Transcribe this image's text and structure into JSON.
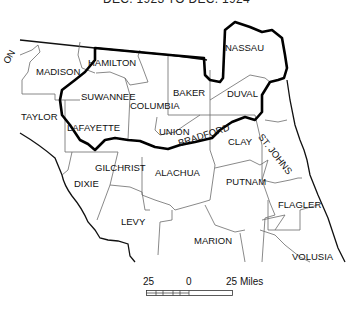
{
  "caption": "DEC. 1923 TO DEC. 1924",
  "counties": [
    {
      "name": "ON",
      "x": 14,
      "y": 52,
      "rotate": -60
    },
    {
      "name": "MADISON",
      "x": 36,
      "y": 67
    },
    {
      "name": "HAMILTON",
      "x": 88,
      "y": 58
    },
    {
      "name": "NASSAU",
      "x": 225,
      "y": 43
    },
    {
      "name": "BAKER",
      "x": 173,
      "y": 88
    },
    {
      "name": "DUVAL",
      "x": 227,
      "y": 89
    },
    {
      "name": "SUWANNEE",
      "x": 81,
      "y": 92
    },
    {
      "name": "COLUMBIA",
      "x": 130,
      "y": 101
    },
    {
      "name": "TAYLOR",
      "x": 21,
      "y": 112
    },
    {
      "name": "LAFAYETTE",
      "x": 67,
      "y": 123
    },
    {
      "name": "UNION",
      "x": 159,
      "y": 127
    },
    {
      "name": "BRADFORD",
      "x": 177,
      "y": 142,
      "rotate": -18
    },
    {
      "name": "CLAY",
      "x": 228,
      "y": 137
    },
    {
      "name": "ST. JOHNS",
      "x": 262,
      "y": 142,
      "rotate": 52
    },
    {
      "name": "GILCHRIST",
      "x": 95,
      "y": 163
    },
    {
      "name": "ALACHUA",
      "x": 155,
      "y": 168
    },
    {
      "name": "DIXIE",
      "x": 74,
      "y": 179
    },
    {
      "name": "PUTNAM",
      "x": 226,
      "y": 177
    },
    {
      "name": "FLAGLER",
      "x": 278,
      "y": 200
    },
    {
      "name": "LEVY",
      "x": 121,
      "y": 217
    },
    {
      "name": "MARION",
      "x": 194,
      "y": 236
    },
    {
      "name": "VOLUSIA",
      "x": 292,
      "y": 252
    }
  ],
  "scale": {
    "left_label": "25",
    "center_label": "0",
    "right_label": "25 Miles"
  },
  "colors": {
    "basin_outline": "#000000",
    "county_lines": "#6b6b6b",
    "background": "#ffffff"
  }
}
